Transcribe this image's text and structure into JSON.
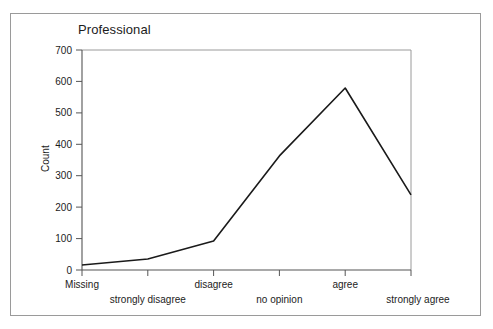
{
  "chart_data": {
    "type": "line",
    "title": "Professional",
    "xlabel": "",
    "ylabel": "Count",
    "categories": [
      "Missing",
      "strongly disagree",
      "disagree",
      "no opinion",
      "agree",
      "strongly agree"
    ],
    "values": [
      16,
      35,
      92,
      363,
      579,
      239
    ],
    "ylim": [
      0,
      700
    ],
    "yticks": [
      0,
      100,
      200,
      300,
      400,
      500,
      600,
      700
    ],
    "ytick_labels": [
      "0",
      "100",
      "200",
      "300",
      "400",
      "500",
      "600",
      "700"
    ],
    "grid": false,
    "legend": "none",
    "line_color": "#1a1a1a",
    "axis_color": "#555555",
    "frame_color": "#9a9a9a",
    "background": "#ffffff"
  },
  "figure": {
    "border_color": "#9a9a9a",
    "background": "#ffffff"
  }
}
